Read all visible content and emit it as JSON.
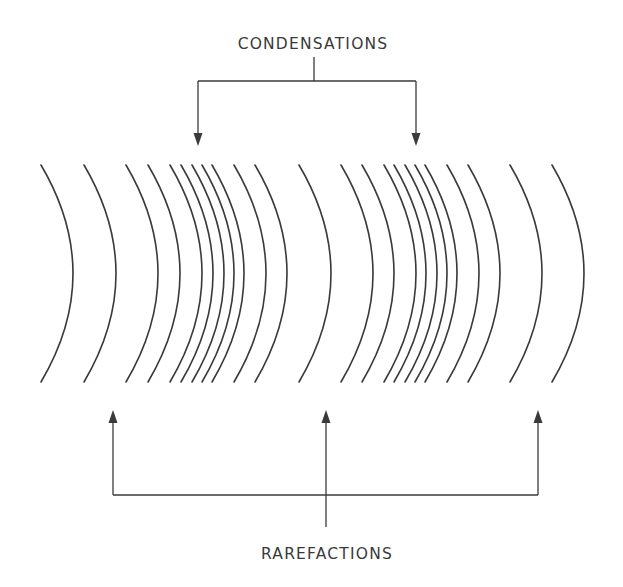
{
  "diagram": {
    "labels": {
      "condensations": "CONDENSATIONS",
      "rarefactions": "RAREFACTIONS"
    },
    "colors": {
      "line": "#3a3a3a",
      "background": "#ffffff"
    },
    "wavefronts": {
      "top_y": 165,
      "bottom_y": 382,
      "bulge": 32,
      "mid_x": [
        73,
        116,
        158,
        180,
        202,
        213,
        224,
        234,
        244,
        266,
        287,
        331,
        373,
        394,
        416,
        426,
        437,
        447,
        457,
        479,
        500,
        542,
        584
      ]
    },
    "condensation_arrows": {
      "bracket_y": 81,
      "stem_x": 314,
      "stem_top_y": 57,
      "arrow_x": [
        198,
        416
      ],
      "tip_y": 146
    },
    "rarefaction_arrows": {
      "bracket_y": 495,
      "stem_x": 326,
      "stem_bottom_y": 527,
      "arrow_x": [
        113,
        326,
        538
      ],
      "tip_y": 410
    }
  }
}
